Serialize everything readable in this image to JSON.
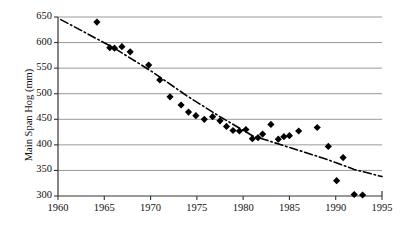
{
  "chart_data": {
    "type": "scatter",
    "title": "",
    "xlabel": "",
    "ylabel": "Main Span Hog (mm)",
    "xlim": [
      1960,
      1995
    ],
    "ylim": [
      300,
      650
    ],
    "xticks": [
      1960,
      1965,
      1970,
      1975,
      1980,
      1985,
      1990,
      1995
    ],
    "yticks": [
      300,
      350,
      400,
      450,
      500,
      550,
      600,
      650
    ],
    "grid": "horizontal",
    "legend": "none",
    "marker": "filled-diamond",
    "marker_color": "#000000",
    "series": [
      {
        "name": "Main Span Hog",
        "points": [
          [
            1964.2,
            640
          ],
          [
            1965.6,
            590
          ],
          [
            1966.1,
            589
          ],
          [
            1966.9,
            592
          ],
          [
            1967.8,
            582
          ],
          [
            1969.8,
            556
          ],
          [
            1971.0,
            527
          ],
          [
            1972.1,
            494
          ],
          [
            1973.3,
            478
          ],
          [
            1974.1,
            464
          ],
          [
            1974.9,
            457
          ],
          [
            1975.8,
            450
          ],
          [
            1976.7,
            455
          ],
          [
            1977.5,
            447
          ],
          [
            1978.2,
            436
          ],
          [
            1978.9,
            428
          ],
          [
            1979.6,
            427
          ],
          [
            1980.3,
            430
          ],
          [
            1981.0,
            412
          ],
          [
            1981.6,
            414
          ],
          [
            1982.1,
            421
          ],
          [
            1983.0,
            440
          ],
          [
            1983.8,
            411
          ],
          [
            1984.4,
            416
          ],
          [
            1985.0,
            418
          ],
          [
            1986.0,
            427
          ],
          [
            1988.0,
            434
          ],
          [
            1989.2,
            397
          ],
          [
            1990.8,
            375
          ],
          [
            1990.1,
            330
          ],
          [
            1992.0,
            303
          ],
          [
            1992.9,
            302
          ]
        ]
      }
    ],
    "trendline": {
      "style": "dash-dot",
      "color": "#000000",
      "points": [
        [
          1960.3,
          645
        ],
        [
          1966.0,
          590
        ],
        [
          1970.0,
          545
        ],
        [
          1974.0,
          495
        ],
        [
          1977.5,
          455
        ],
        [
          1981.0,
          418
        ],
        [
          1985.0,
          395
        ],
        [
          1989.0,
          372
        ],
        [
          1992.0,
          352
        ],
        [
          1995.0,
          338
        ]
      ]
    }
  },
  "axes": {
    "y_title": "Main Span Hog (mm)",
    "y_tick_labels": [
      "650",
      "600",
      "550",
      "500",
      "450",
      "400",
      "350",
      "300"
    ],
    "x_tick_labels": [
      "1960",
      "1965",
      "1970",
      "1975",
      "1980",
      "1985",
      "1990",
      "1995"
    ]
  }
}
